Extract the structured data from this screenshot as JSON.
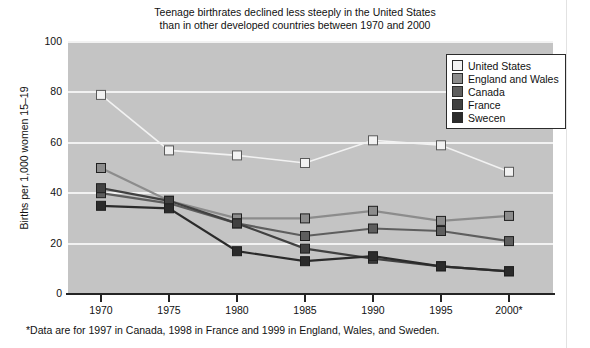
{
  "chart_data": {
    "type": "line",
    "title": "Teenage birthrates declined less steeply in the United States than in other developed countries between 1970 and 2000",
    "title_lines": [
      "Teenage birthrates declined less steeply in the United States",
      "than in other developed countries between 1970 and 2000"
    ],
    "xlabel": "",
    "ylabel": "Births per 1,000 women 15–19",
    "categories": [
      "1970",
      "1975",
      "1980",
      "1985",
      "1990",
      "1995",
      "2000*"
    ],
    "x": [
      1970,
      1975,
      1980,
      1985,
      1990,
      1995,
      2000
    ],
    "ylim": [
      0,
      100
    ],
    "yticks": [
      "0",
      "20",
      "40",
      "60",
      "80",
      "100"
    ],
    "ytick_values": [
      0,
      20,
      40,
      60,
      80,
      100
    ],
    "grid": "horizontal",
    "legend_position": "top-right",
    "plot_background": "#c4c4c4",
    "series": [
      {
        "name": "United States",
        "color": "#f2f2f2",
        "values": [
          79,
          57,
          55,
          52,
          61,
          59,
          48.5
        ]
      },
      {
        "name": "England and Wales",
        "color": "#8c8c8c",
        "values": [
          50,
          37,
          30,
          30,
          33,
          29,
          31
        ]
      },
      {
        "name": "Canada",
        "color": "#5e5e5e",
        "values": [
          40,
          36,
          28,
          23,
          26,
          25,
          21
        ]
      },
      {
        "name": "France",
        "color": "#414141",
        "values": [
          42,
          37,
          28,
          18,
          14,
          11,
          9
        ]
      },
      {
        "name": "Sweden",
        "color": "#2b2b2b",
        "values": [
          35,
          34,
          17,
          13,
          15,
          11,
          9
        ]
      }
    ],
    "footnote": "*Data are for 1997 in Canada, 1998 in France and 1999 in England, Wales, and Sweden."
  },
  "legend": {
    "items": [
      {
        "label": "United States",
        "color": "#f2f2f2"
      },
      {
        "label": "England and Wales",
        "color": "#8c8c8c"
      },
      {
        "label": "Canada",
        "color": "#5e5e5e"
      },
      {
        "label": "France",
        "color": "#414141"
      },
      {
        "label": "Swecen",
        "color": "#2b2b2b"
      }
    ]
  }
}
